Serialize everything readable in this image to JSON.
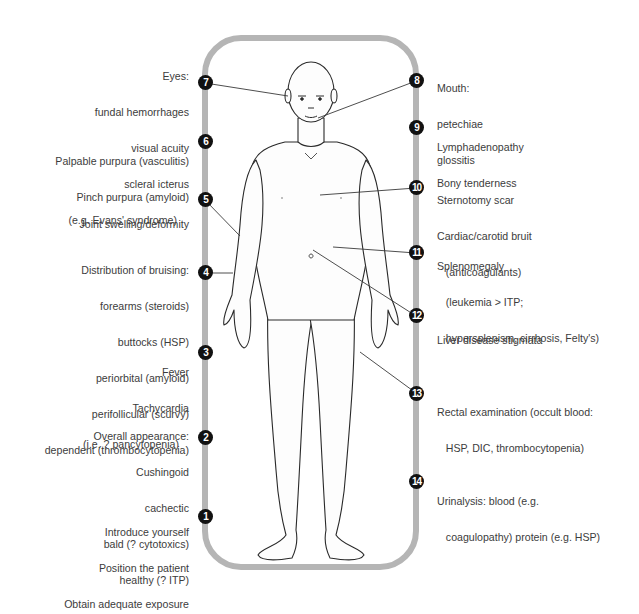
{
  "colors": {
    "track": "#b5b5b5",
    "badge_fill": "#111111",
    "badge_text": "#ffffff",
    "leader_line": "#3a3a3a",
    "body_outline": "#2a2a2a",
    "text": "#3c3c3c"
  },
  "left_items": [
    {
      "number": "7",
      "lines": [
        "Eyes:",
        "fundal hemorrhages",
        "visual acuity",
        "scleral icterus",
        "(e.g. Evans' syndrome)"
      ]
    },
    {
      "number": "6",
      "lines": [
        "Palpable purpura (vasculitis)",
        "Pinch purpura (amyloid)"
      ]
    },
    {
      "number": "5",
      "lines": [
        "Joint swelling/deformity"
      ]
    },
    {
      "number": "4",
      "lines": [
        "Distribution of bruising:",
        "forearms (steroids)",
        "buttocks (HSP)",
        "periorbital (amyloid)",
        "perifollicular (scurvy)",
        "dependent (thrombocytopenia)"
      ]
    },
    {
      "number": "3",
      "lines": [
        "Fever",
        "Tachycardia",
        "(i.e. ? pancytopenia)"
      ]
    },
    {
      "number": "2",
      "lines": [
        "Overall appearance:",
        "Cushingoid",
        "cachectic",
        "bald (? cytotoxics)",
        "healthy (? ITP)"
      ]
    },
    {
      "number": "1",
      "lines": [
        "Introduce yourself",
        "Position the patient",
        "Obtain adequate exposure"
      ]
    }
  ],
  "right_items": [
    {
      "number": "8",
      "lines": [
        "Mouth:",
        "petechiae",
        "glossitis"
      ]
    },
    {
      "number": "9",
      "lines": [
        "Lymphadenopathy",
        "Bony tenderness"
      ]
    },
    {
      "number": "10",
      "lines": [
        "Sternotomy scar",
        "Cardiac/carotid bruit",
        "   (anticoagulants)"
      ]
    },
    {
      "number": "11",
      "lines": [
        "Splenomegaly",
        "   (leukemia > ITP;",
        "   hypersplenism, cirrhosis, Felty's)"
      ]
    },
    {
      "number": "12",
      "lines": [
        "Liver disease stigmata"
      ]
    },
    {
      "number": "13",
      "lines": [
        "Rectal examination (occult blood:",
        "   HSP, DIC, thrombocytopenia)"
      ]
    },
    {
      "number": "14",
      "lines": [
        "Urinalysis: blood (e.g.",
        "   coagulopathy) protein (e.g. HSP)"
      ]
    }
  ]
}
